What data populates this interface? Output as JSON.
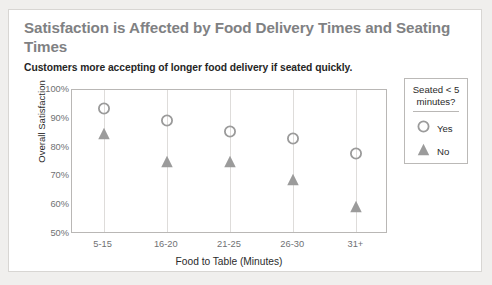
{
  "card": {
    "title": "Satisfaction is Affected by Food Delivery Times and Seating Times",
    "subtitle": "Customers more accepting of longer food delivery if seated quickly."
  },
  "colors": {
    "title": "#7f8183",
    "subtitle": "#262626",
    "marker": "#9b9b9b",
    "gridline": "#dedcda",
    "frame": "#b9b7b5",
    "card_border": "#d8d6d3",
    "page_background": "#f0efed"
  },
  "legend": {
    "title_line1": "Seated < 5",
    "title_line2": "minutes?",
    "items": [
      {
        "label": "Yes",
        "marker": "circle-outline-icon"
      },
      {
        "label": "No",
        "marker": "triangle-filled-icon"
      }
    ]
  },
  "chart_data": {
    "type": "scatter",
    "title": "Satisfaction is Affected by Food Delivery Times and Seating Times",
    "subtitle": "Customers more accepting of longer food delivery if seated quickly.",
    "xlabel": "Food to Table (Minutes)",
    "ylabel": "Overall Satisfaction",
    "categories": [
      "5-15",
      "16-20",
      "21-25",
      "26-30",
      "31+"
    ],
    "ylim": [
      50,
      100
    ],
    "yticks": [
      "50%",
      "60%",
      "70%",
      "80%",
      "90%",
      "100%"
    ],
    "ytick_values": [
      50,
      60,
      70,
      80,
      90,
      100
    ],
    "grid": "vertical",
    "legend_position": "right",
    "series": [
      {
        "name": "Yes",
        "marker": "circle-outline-icon",
        "values": [
          93,
          89,
          85,
          82.5,
          77.5
        ]
      },
      {
        "name": "No",
        "marker": "triangle-filled-icon",
        "values": [
          84.5,
          74.5,
          74.5,
          68.5,
          59
        ]
      }
    ]
  }
}
